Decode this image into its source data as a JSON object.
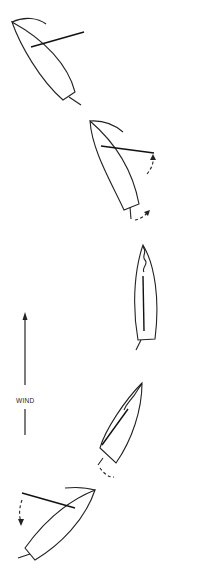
{
  "diagram": {
    "type": "sailboat-tacking-sequence",
    "wind": {
      "label": "WIND",
      "direction": "up"
    },
    "boats": [
      {
        "step": 1,
        "description": "close-hauled on starboard, sail out to the right"
      },
      {
        "step": 2,
        "description": "beginning to turn into the wind, rudder and boom motion arrows"
      },
      {
        "step": 3,
        "description": "head to wind, sail luffing along centerline"
      },
      {
        "step": 4,
        "description": "turning through to new tack, sail crossing over"
      },
      {
        "step": 5,
        "description": "settled on new tack, boom swung to the left"
      }
    ],
    "colors": {
      "line": "#222222",
      "background": "#ffffff"
    }
  }
}
